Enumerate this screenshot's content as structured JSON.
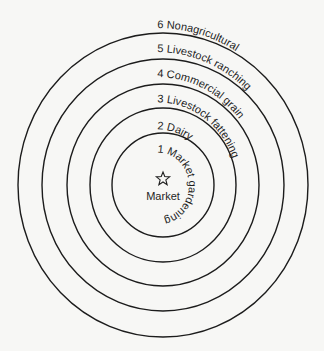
{
  "diagram": {
    "center": {
      "x": 163,
      "y": 185
    },
    "market": {
      "label": "Market",
      "icon": "star-icon"
    },
    "rings": [
      {
        "rx": 51,
        "ry": 52
      },
      {
        "rx": 73,
        "ry": 77
      },
      {
        "rx": 96,
        "ry": 101
      },
      {
        "rx": 121,
        "ry": 126
      },
      {
        "rx": 145,
        "ry": 152
      }
    ],
    "zones": [
      {
        "number": "1",
        "name": "Market gardening",
        "label": "1  Market gardening",
        "radius": 33
      },
      {
        "number": "2",
        "name": "Dairy",
        "label": "2  Dairy",
        "radius": 56
      },
      {
        "number": "3",
        "name": "Livestock fattening",
        "label": "3  Livestock fattening",
        "radius": 83
      },
      {
        "number": "4",
        "name": "Commercial grain",
        "label": "4  Commercial grain",
        "radius": 108
      },
      {
        "number": "5",
        "name": "Livestock ranching",
        "label": "5  Livestock ranching",
        "radius": 133
      },
      {
        "number": "6",
        "name": "Nonagricultural",
        "label": "6  Nonagricultural",
        "radius": 157
      }
    ]
  }
}
